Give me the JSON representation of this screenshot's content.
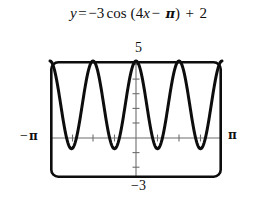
{
  "equation": {
    "lhs": "y",
    "equals": "=",
    "amplitude_sign": "−",
    "amplitude": "3",
    "function": "cos",
    "open_paren": "(",
    "frequency": "4",
    "variable": "x",
    "minus": "−",
    "phase": "π",
    "close_paren": ")",
    "plus": "+",
    "vertical_shift": "2",
    "full_text": "y = −3 cos (4x − π) + 2"
  },
  "labels": {
    "y_max": "5",
    "y_min": "−3",
    "x_min_minus": "−",
    "x_min_pi": "π",
    "x_max_pi": "π"
  },
  "colors": {
    "curve": "#0d0d0d",
    "frame": "#0d0d0d",
    "axis": "#6e6e6e",
    "background": "#ffffff",
    "text": "#100f0f"
  },
  "chart_data": {
    "type": "line",
    "xlabel": "",
    "ylabel": "",
    "xlim": [
      -3.14159265,
      3.14159265
    ],
    "ylim": [
      -3,
      5
    ],
    "xtick_labels": [
      "−π",
      "π"
    ],
    "ytick_labels": [
      "−3",
      "5"
    ],
    "xtick_values": [
      -3.14159265,
      3.14159265
    ],
    "ytick_values": [
      -3,
      5
    ],
    "x_tick_step": 0.78539816,
    "y_tick_step": 1,
    "grid": false,
    "legend": false,
    "axes_style": "centered-cross-in-box",
    "function_expression": "y = -3*cos(4*x - pi) + 2",
    "amplitude": 3,
    "period": 1.57079633,
    "phase_shift": 0.78539816,
    "vertical_shift": 2,
    "y_range_of_curve": [
      -1,
      5
    ],
    "maxima_y": 5,
    "minima_y": -1,
    "maxima_x": [
      -3.14159265,
      -1.57079633,
      0,
      1.57079633,
      3.14159265
    ],
    "minima_x": [
      -2.35619449,
      -0.78539816,
      0.78539816,
      2.35619449
    ],
    "series": [
      {
        "name": "y = -3cos(4x - pi) + 2",
        "x": [
          -3.14159265,
          -2.94524311,
          -2.74889357,
          -2.55254403,
          -2.35619449,
          -2.15984495,
          -1.96349541,
          -1.76714587,
          -1.57079633,
          -1.37444679,
          -1.17809725,
          -0.9817477,
          -0.78539816,
          -0.58904862,
          -0.39269908,
          -0.19634954,
          0,
          0.19634954,
          0.39269908,
          0.58904862,
          0.78539816,
          0.9817477,
          1.17809725,
          1.37444679,
          1.57079633,
          1.76714587,
          1.96349541,
          2.15984495,
          2.35619449,
          2.55254403,
          2.74889357,
          2.94524311,
          3.14159265
        ],
        "y": [
          5,
          4.121,
          2,
          -0.121,
          -1,
          -0.121,
          2,
          4.121,
          5,
          4.121,
          2,
          -0.121,
          -1,
          -0.121,
          2,
          4.121,
          5,
          4.121,
          2,
          -0.121,
          -1,
          -0.121,
          2,
          4.121,
          5,
          4.121,
          2,
          -0.121,
          -1,
          -0.121,
          2,
          4.121,
          5
        ]
      }
    ]
  }
}
